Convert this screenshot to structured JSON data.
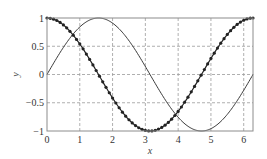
{
  "chart_data": {
    "type": "line",
    "title": "",
    "xlabel": "x",
    "ylabel": "y",
    "xlim": [
      0,
      6.2832
    ],
    "ylim": [
      -1,
      1
    ],
    "grid": true,
    "grid_style": "dashed",
    "legend": null,
    "x_ticks": [
      0,
      1,
      2,
      3,
      4,
      5,
      6
    ],
    "x_tick_labels": [
      "0",
      "1",
      "2",
      "3",
      "4",
      "5",
      "6"
    ],
    "y_ticks": [
      1,
      0.5,
      0,
      -0.5,
      -1
    ],
    "y_tick_labels": [
      "1",
      "0.5",
      "0",
      "−0.5",
      "−1"
    ],
    "series": [
      {
        "name": "sin(x)",
        "style": "solid line",
        "color": "#3a3a3a",
        "function": "sin",
        "x_range": [
          0,
          6.2832
        ],
        "sample_points": [
          {
            "x": 0,
            "y": 0
          },
          {
            "x": 1.5708,
            "y": 1
          },
          {
            "x": 3.1416,
            "y": 0
          },
          {
            "x": 4.7124,
            "y": -1
          },
          {
            "x": 6.2832,
            "y": 0
          }
        ]
      },
      {
        "name": "cos(x)",
        "style": "line with dot markers",
        "color": "#222222",
        "function": "cos",
        "x_range": [
          0,
          6.2832
        ],
        "marker_step": 0.1,
        "sample_points": [
          {
            "x": 0,
            "y": 1
          },
          {
            "x": 1.5708,
            "y": 0
          },
          {
            "x": 3.1416,
            "y": -1
          },
          {
            "x": 4.7124,
            "y": 0
          },
          {
            "x": 6.2832,
            "y": 1
          }
        ]
      }
    ]
  },
  "colors": {
    "background": "#ffffff",
    "frame": "#8c8c8c",
    "grid": "#9a9a9a"
  }
}
